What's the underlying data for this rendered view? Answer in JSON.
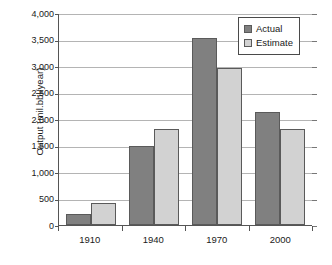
{
  "chart_data": {
    "type": "bar",
    "title": "",
    "subtitle": "",
    "xlabel": "",
    "ylabel": "Output (mil.bbl/year)",
    "categories": [
      "1910",
      "1940",
      "1970",
      "2000"
    ],
    "series": [
      {
        "name": "Actual",
        "color": "#808080",
        "values": [
          200,
          1500,
          3520,
          2140
        ]
      },
      {
        "name": "Estimate",
        "color": "#d2d2d2",
        "values": [
          410,
          1810,
          2970,
          1810
        ]
      }
    ],
    "ylim": [
      0,
      4000
    ],
    "ytick_values": [
      0,
      500,
      1000,
      1500,
      2000,
      2500,
      3000,
      3500,
      4000
    ],
    "ytick_labels": [
      "0",
      "500",
      "1,000",
      "1,500",
      "2,000",
      "2,500",
      "3,000",
      "3,500",
      "4,000"
    ],
    "grid": true,
    "grid_axis": "y",
    "legend_position": "top-right",
    "legend_entries": [
      "Actual",
      "Estimate"
    ],
    "background_color": "#ffffff",
    "axis_color": "#555555",
    "gridline_color": "#b4b4b4"
  }
}
